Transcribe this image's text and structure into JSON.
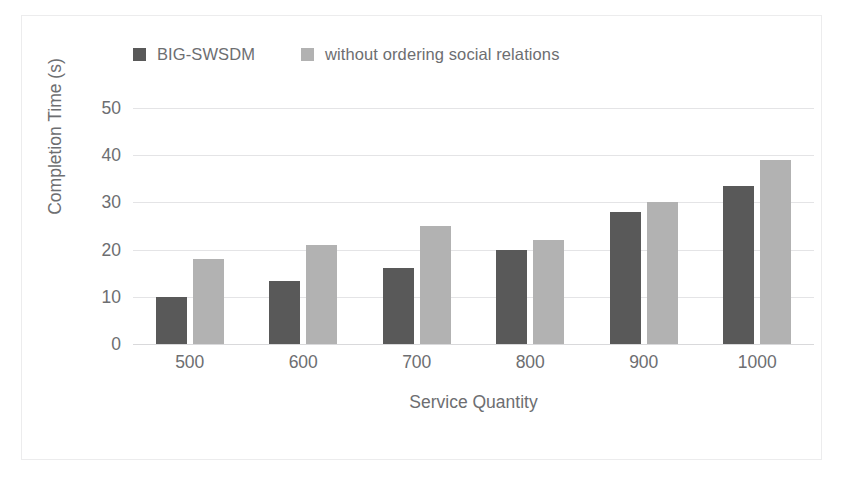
{
  "chart_data": {
    "type": "bar",
    "title": "",
    "xlabel": "Service Quantity",
    "ylabel": "Completion Time (s)",
    "categories": [
      "500",
      "600",
      "700",
      "800",
      "900",
      "1000"
    ],
    "series": [
      {
        "name": "BIG-SWSDM",
        "color": "#595959",
        "values": [
          10,
          13.3,
          16,
          20,
          28,
          33.5
        ]
      },
      {
        "name": "without ordering social relations",
        "color": "#b2b2b2",
        "values": [
          18,
          21,
          25,
          22,
          30,
          39
        ]
      }
    ],
    "ylim": [
      0,
      50
    ],
    "yticks": [
      "50",
      "40",
      "30",
      "20",
      "10",
      "0"
    ],
    "ytick_values": [
      50,
      40,
      30,
      20,
      10,
      0
    ],
    "grid": true,
    "legend_position": "top"
  }
}
